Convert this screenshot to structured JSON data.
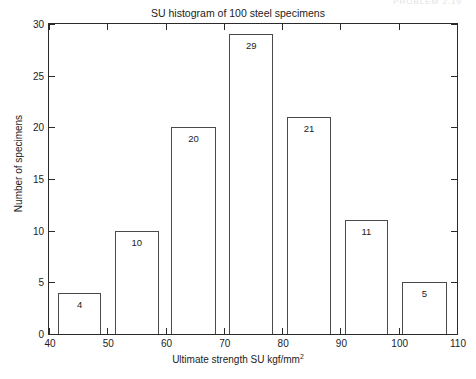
{
  "page_header": {
    "text": "PROBLEM 2.19",
    "visible": true
  },
  "chart_data": {
    "type": "bar",
    "title": "SU histogram of 100 steel specimens",
    "xlabel_main": "Ultimate strength SU kgf/mm",
    "xlabel_sup": "2",
    "ylabel": "Number of specimens",
    "xlim": [
      40,
      110
    ],
    "ylim": [
      0,
      30
    ],
    "xticks": [
      40,
      50,
      60,
      70,
      80,
      90,
      100,
      110
    ],
    "yticks": [
      0,
      5,
      10,
      15,
      20,
      25,
      30
    ],
    "grid": false,
    "legend": null,
    "bin_width": 10,
    "bin_edges": [
      40,
      50,
      60,
      70,
      80,
      90,
      100,
      110
    ],
    "categories": [
      "40-50",
      "50-60",
      "60-70",
      "70-80",
      "80-90",
      "90-100",
      "100-110"
    ],
    "values": [
      4,
      10,
      20,
      29,
      21,
      11,
      5
    ],
    "bars": [
      {
        "label": "4",
        "value": 4,
        "bin_start": 40,
        "bin_end": 50,
        "bar_left": 41.5,
        "bar_right": 49.0
      },
      {
        "label": "10",
        "value": 10,
        "bin_start": 50,
        "bin_end": 60,
        "bar_left": 51.3,
        "bar_right": 58.8
      },
      {
        "label": "20",
        "value": 20,
        "bin_start": 60,
        "bin_end": 70,
        "bar_left": 61.0,
        "bar_right": 68.6
      },
      {
        "label": "29",
        "value": 29,
        "bin_start": 70,
        "bin_end": 80,
        "bar_left": 70.9,
        "bar_right": 78.5
      },
      {
        "label": "21",
        "value": 21,
        "bin_start": 80,
        "bin_end": 90,
        "bar_left": 80.8,
        "bar_right": 88.4
      },
      {
        "label": "11",
        "value": 11,
        "bin_start": 90,
        "bin_end": 100,
        "bar_left": 90.7,
        "bar_right": 98.2
      },
      {
        "label": "5",
        "value": 5,
        "bin_start": 100,
        "bin_end": 110,
        "bar_left": 100.6,
        "bar_right": 108.2
      }
    ],
    "total": 100,
    "colors": {
      "bar_edge": "#4a4a4a",
      "bar_fill": "transparent",
      "axis": "#2a2a2a",
      "text": "#1c1c1c",
      "background": "#ffffff"
    }
  },
  "ytick_labels": [
    "0",
    "5",
    "10",
    "15",
    "20",
    "25",
    "30"
  ],
  "xtick_labels": [
    "40",
    "50",
    "60",
    "70",
    "80",
    "90",
    "100",
    "110"
  ]
}
